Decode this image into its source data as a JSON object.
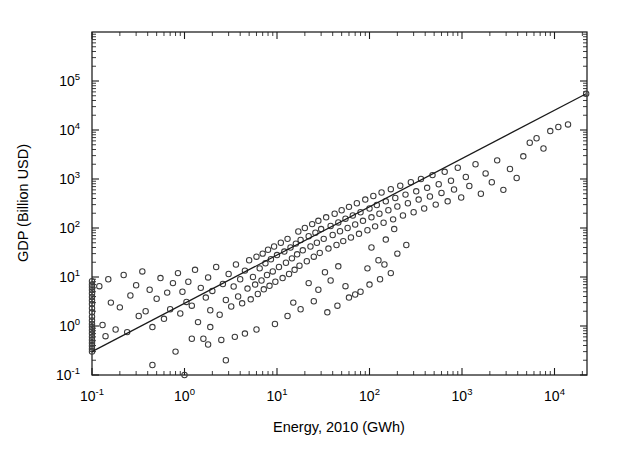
{
  "chart_data": {
    "type": "scatter",
    "title": "",
    "xlabel": "Energy, 2010 (GWh)",
    "ylabel": "GDP (Billion USD)",
    "xscale": "log",
    "yscale": "log",
    "xlim": [
      0.1,
      30000
    ],
    "ylim": [
      0.1,
      100000
    ],
    "grid": false,
    "legend": null,
    "marker_style": "open-circle",
    "xtick_labels": [
      "10-1",
      "100",
      "101",
      "102",
      "103",
      "104"
    ],
    "xtick_values": [
      0.1,
      1,
      10,
      100,
      1000,
      10000
    ],
    "ytick_labels": [
      "10-1",
      "100",
      "101",
      "102",
      "103",
      "104",
      "105"
    ],
    "ytick_values": [
      0.1,
      1,
      10,
      100,
      1000,
      10000,
      100000
    ],
    "xtick_mantissas": [
      "10",
      "10",
      "10",
      "10",
      "10",
      "10"
    ],
    "xtick_exponents": [
      "-1",
      "0",
      "1",
      "2",
      "3",
      "4"
    ],
    "ytick_mantissas": [
      "10",
      "10",
      "10",
      "10",
      "10",
      "10",
      "10"
    ],
    "ytick_exponents": [
      "-1",
      "0",
      "1",
      "2",
      "3",
      "4",
      "5"
    ],
    "fit_line": {
      "x": [
        0.1,
        22000
      ],
      "y": [
        0.3,
        55000
      ],
      "slope_loglog": 0.945,
      "description": "power-law regression line"
    },
    "points": [
      [
        0.1,
        8.2
      ],
      [
        0.1,
        7.0
      ],
      [
        0.1,
        6.2
      ],
      [
        0.1,
        5.4
      ],
      [
        0.1,
        4.6
      ],
      [
        0.1,
        3.9
      ],
      [
        0.1,
        3.3
      ],
      [
        0.1,
        2.8
      ],
      [
        0.1,
        2.3
      ],
      [
        0.1,
        1.9
      ],
      [
        0.1,
        1.55
      ],
      [
        0.1,
        1.3
      ],
      [
        0.1,
        1.1
      ],
      [
        0.1,
        0.95
      ],
      [
        0.1,
        0.82
      ],
      [
        0.1,
        0.7
      ],
      [
        0.1,
        0.6
      ],
      [
        0.1,
        0.52
      ],
      [
        0.1,
        0.45
      ],
      [
        0.1,
        0.39
      ],
      [
        0.1,
        0.34
      ],
      [
        0.1,
        0.3
      ],
      [
        0.12,
        6.5
      ],
      [
        0.13,
        1.05
      ],
      [
        0.14,
        0.62
      ],
      [
        0.15,
        9.0
      ],
      [
        0.16,
        3.0
      ],
      [
        0.18,
        0.85
      ],
      [
        0.2,
        2.4
      ],
      [
        0.22,
        11.0
      ],
      [
        0.24,
        0.75
      ],
      [
        0.26,
        4.2
      ],
      [
        0.3,
        6.8
      ],
      [
        0.32,
        1.6
      ],
      [
        0.35,
        13.0
      ],
      [
        0.38,
        2.0
      ],
      [
        0.42,
        5.5
      ],
      [
        0.45,
        0.95
      ],
      [
        0.5,
        3.6
      ],
      [
        0.55,
        9.5
      ],
      [
        0.6,
        1.4
      ],
      [
        0.65,
        4.8
      ],
      [
        0.7,
        2.2
      ],
      [
        0.75,
        7.5
      ],
      [
        0.8,
        0.3
      ],
      [
        0.85,
        12.0
      ],
      [
        0.9,
        1.8
      ],
      [
        0.95,
        5.0
      ],
      [
        1.0,
        0.1
      ],
      [
        1.05,
        3.1
      ],
      [
        1.1,
        8.0
      ],
      [
        1.2,
        2.6
      ],
      [
        1.3,
        14.0
      ],
      [
        1.4,
        1.2
      ],
      [
        1.5,
        6.0
      ],
      [
        1.6,
        0.55
      ],
      [
        1.7,
        3.8
      ],
      [
        1.8,
        9.8
      ],
      [
        1.9,
        2.1
      ],
      [
        2.0,
        5.2
      ],
      [
        2.2,
        16.0
      ],
      [
        2.4,
        1.7
      ],
      [
        2.6,
        7.2
      ],
      [
        2.8,
        3.4
      ],
      [
        3.0,
        11.5
      ],
      [
        3.2,
        2.5
      ],
      [
        3.4,
        6.4
      ],
      [
        3.6,
        18.0
      ],
      [
        3.8,
        4.0
      ],
      [
        4.0,
        9.0
      ],
      [
        4.2,
        2.9
      ],
      [
        4.5,
        13.5
      ],
      [
        4.8,
        5.8
      ],
      [
        5.0,
        22.0
      ],
      [
        5.2,
        3.5
      ],
      [
        5.5,
        10.0
      ],
      [
        5.8,
        7.0
      ],
      [
        6.0,
        26.0
      ],
      [
        6.2,
        4.5
      ],
      [
        6.5,
        15.0
      ],
      [
        6.8,
        8.5
      ],
      [
        7.0,
        30.0
      ],
      [
        7.2,
        5.6
      ],
      [
        7.5,
        19.0
      ],
      [
        7.8,
        11.0
      ],
      [
        8.0,
        36.0
      ],
      [
        8.3,
        6.6
      ],
      [
        8.6,
        23.0
      ],
      [
        9.0,
        13.0
      ],
      [
        9.3,
        42.0
      ],
      [
        9.6,
        8.0
      ],
      [
        10.0,
        28.0
      ],
      [
        10.5,
        16.0
      ],
      [
        11.0,
        50.0
      ],
      [
        11.5,
        9.5
      ],
      [
        12.0,
        33.0
      ],
      [
        12.5,
        19.5
      ],
      [
        13.0,
        60.0
      ],
      [
        13.5,
        11.5
      ],
      [
        14.0,
        40.0
      ],
      [
        14.5,
        24.0
      ],
      [
        15.0,
        3.0
      ],
      [
        15.5,
        14.0
      ],
      [
        16.0,
        48.0
      ],
      [
        16.5,
        29.0
      ],
      [
        17.0,
        85.0
      ],
      [
        17.5,
        17.0
      ],
      [
        18.0,
        57.0
      ],
      [
        19.0,
        35.0
      ],
      [
        20.0,
        100.0
      ],
      [
        21.0,
        21.0
      ],
      [
        22.0,
        68.0
      ],
      [
        23.0,
        42.0
      ],
      [
        24.0,
        120.0
      ],
      [
        25.0,
        26.0
      ],
      [
        26.0,
        80.0
      ],
      [
        27.0,
        50.0
      ],
      [
        28.0,
        140.0
      ],
      [
        29.0,
        31.0
      ],
      [
        30.0,
        95.0
      ],
      [
        32.0,
        60.0
      ],
      [
        34.0,
        165.0
      ],
      [
        36.0,
        38.0
      ],
      [
        38.0,
        110.0
      ],
      [
        40.0,
        72.0
      ],
      [
        42.0,
        195.0
      ],
      [
        44.0,
        45.0
      ],
      [
        46.0,
        130.0
      ],
      [
        48.0,
        86.0
      ],
      [
        50.0,
        230.0
      ],
      [
        52.0,
        54.0
      ],
      [
        55.0,
        155.0
      ],
      [
        58.0,
        100.0
      ],
      [
        60.0,
        270.0
      ],
      [
        63.0,
        64.0
      ],
      [
        66.0,
        180.0
      ],
      [
        70.0,
        118.0
      ],
      [
        73.0,
        320.0
      ],
      [
        77.0,
        76.0
      ],
      [
        80.0,
        210.0
      ],
      [
        85.0,
        140.0
      ],
      [
        90.0,
        380.0
      ],
      [
        95.0,
        90.0
      ],
      [
        100.0,
        250.0
      ],
      [
        105.0,
        165.0
      ],
      [
        110.0,
        450.0
      ],
      [
        115.0,
        108.0
      ],
      [
        120.0,
        295.0
      ],
      [
        128.0,
        195.0
      ],
      [
        135.0,
        530.0
      ],
      [
        142.0,
        128.0
      ],
      [
        150.0,
        350.0
      ],
      [
        160.0,
        230.0
      ],
      [
        170.0,
        620.0
      ],
      [
        180.0,
        150.0
      ],
      [
        190.0,
        410.0
      ],
      [
        200.0,
        275.0
      ],
      [
        215.0,
        730.0
      ],
      [
        230.0,
        180.0
      ],
      [
        245.0,
        480.0
      ],
      [
        260.0,
        320.0
      ],
      [
        280.0,
        860.0
      ],
      [
        300.0,
        210.0
      ],
      [
        320.0,
        560.0
      ],
      [
        340.0,
        380.0
      ],
      [
        360.0,
        1000.0
      ],
      [
        390.0,
        250.0
      ],
      [
        420.0,
        660.0
      ],
      [
        450.0,
        440.0
      ],
      [
        480.0,
        1200.0
      ],
      [
        520.0,
        300.0
      ],
      [
        560.0,
        780.0
      ],
      [
        600.0,
        520.0
      ],
      [
        650.0,
        1400.0
      ],
      [
        700.0,
        350.0
      ],
      [
        760.0,
        920.0
      ],
      [
        820.0,
        610.0
      ],
      [
        900.0,
        1700.0
      ],
      [
        980.0,
        420.0
      ],
      [
        1100.0,
        1100.0
      ],
      [
        1200.0,
        720.0
      ],
      [
        1400.0,
        2000.0
      ],
      [
        1600.0,
        500.0
      ],
      [
        1800.0,
        1300.0
      ],
      [
        2100.0,
        860.0
      ],
      [
        2400.0,
        2400.0
      ],
      [
        2800.0,
        600.0
      ],
      [
        3300.0,
        1600.0
      ],
      [
        3900.0,
        1050.0
      ],
      [
        4600.0,
        2900.0
      ],
      [
        5400.0,
        5500.0
      ],
      [
        6400.0,
        6800.0
      ],
      [
        7600.0,
        4200.0
      ],
      [
        9000.0,
        9500.0
      ],
      [
        11000.0,
        11500.0
      ],
      [
        14000.0,
        13000.0
      ],
      [
        22000.0,
        55000.0
      ],
      [
        3.5,
        0.6
      ],
      [
        4.5,
        0.7
      ],
      [
        6.0,
        0.85
      ],
      [
        1.8,
        0.42
      ],
      [
        2.5,
        0.52
      ],
      [
        13.0,
        1.6
      ],
      [
        18.0,
        2.2
      ],
      [
        25.0,
        3.2
      ],
      [
        35.0,
        1.9
      ],
      [
        45.0,
        2.6
      ],
      [
        60.0,
        3.8
      ],
      [
        80.0,
        5.0
      ],
      [
        100.0,
        7.0
      ],
      [
        130.0,
        9.0
      ],
      [
        170.0,
        12.0
      ],
      [
        55.0,
        6.5
      ],
      [
        70.0,
        4.4
      ],
      [
        28.0,
        5.5
      ],
      [
        38.0,
        8.5
      ],
      [
        95.0,
        15.0
      ],
      [
        125.0,
        22.0
      ],
      [
        145.0,
        18.0
      ],
      [
        200.0,
        30.0
      ],
      [
        250.0,
        45.0
      ],
      [
        22.0,
        7.5
      ],
      [
        0.45,
        0.16
      ],
      [
        1.2,
        0.55
      ],
      [
        1.9,
        0.95
      ],
      [
        2.8,
        0.2
      ],
      [
        9.5,
        1.1
      ],
      [
        150.0,
        58.0
      ],
      [
        105.0,
        40.0
      ],
      [
        185.0,
        95.0
      ],
      [
        33.0,
        12.5
      ],
      [
        46.0,
        16.5
      ]
    ],
    "point_count": 229
  }
}
